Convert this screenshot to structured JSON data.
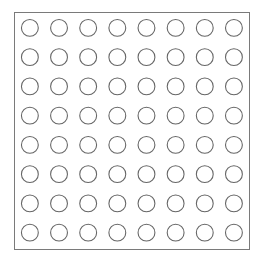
{
  "grid": {
    "rows": 8,
    "cols": 8,
    "cell_state": "empty",
    "colors": {
      "circle_stroke": "#666666",
      "circle_fill": "#ffffff",
      "border": "#7a7a7a",
      "background": "#ffffff"
    }
  }
}
